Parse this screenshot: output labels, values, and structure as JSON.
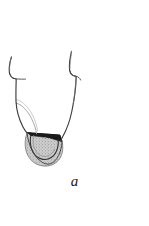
{
  "figure": {
    "caption": "a",
    "colors": {
      "background": "#ffffff",
      "outline": "#3a3a3a",
      "outline_dark": "#1c1c1c",
      "inner_line": "#8a8a8a",
      "wedge_fill": "#141414",
      "stipple_fill": "#c9c9c9",
      "stipple_dot": "#6e6e6e",
      "caption_text": "#1a1a1a"
    },
    "shapes": {
      "left_cusp_tip": "left-cusp-tip",
      "right_cusp_tip": "right-cusp-tip",
      "left_outer_wall": "left-outer-wall",
      "right_outer_wall": "right-outer-wall",
      "inner_guide_line": "inner-guide-line",
      "dark_wedge": "dark-wedge",
      "stippled_region": "stippled-lesion-region",
      "inner_arc": "inner-arc"
    }
  }
}
